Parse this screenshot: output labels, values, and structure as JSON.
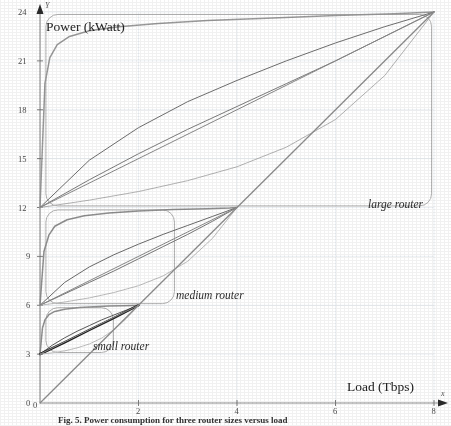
{
  "figure": {
    "caption": "Fig. 5. Power consumption for three router sizes versus load",
    "y_axis": {
      "title": "Power (kWatt)",
      "arrow_letter": "Y",
      "ticks": [
        0,
        3,
        6,
        9,
        12,
        15,
        18,
        21,
        24
      ],
      "range": [
        0,
        24
      ]
    },
    "x_axis": {
      "title": "Load (Tbps)",
      "arrow_letter": "x",
      "ticks": [
        0,
        2,
        4,
        6,
        8
      ],
      "range": [
        0,
        8
      ]
    },
    "groups": [
      {
        "name": "small-router",
        "label": "small router",
        "base_power": 3,
        "max_load": 2
      },
      {
        "name": "medium-router",
        "label": "medium router",
        "base_power": 6,
        "max_load": 4
      },
      {
        "name": "large-router",
        "label": "large router",
        "base_power": 12,
        "max_load": 8
      }
    ]
  },
  "chart_data": {
    "type": "line",
    "title": "",
    "xlabel": "Load (Tbps)",
    "ylabel": "Power (kWatt)",
    "xlim": [
      0,
      8
    ],
    "ylim": [
      0,
      24
    ],
    "xticks": [
      0,
      2,
      4,
      6,
      8
    ],
    "yticks": [
      0,
      3,
      6,
      9,
      12,
      15,
      18,
      21,
      24
    ],
    "grid": true,
    "legend": "annotations",
    "annotations": [
      {
        "text": "small router",
        "x": 2.05,
        "y": 3.3
      },
      {
        "text": "medium router",
        "x": 4.15,
        "y": 6.3
      },
      {
        "text": "large router",
        "x": 8.1,
        "y": 12.4
      }
    ],
    "series": [
      {
        "name": "large-router-step",
        "group": "large router",
        "color": "#9a9a9a",
        "x": [
          0,
          0.1,
          0.2,
          0.35,
          0.6,
          1,
          1.6,
          2.4,
          3.4,
          4.6,
          6,
          7.2,
          8
        ],
        "y": [
          12,
          19.6,
          21.2,
          22.0,
          22.5,
          22.85,
          23.1,
          23.3,
          23.48,
          23.62,
          23.78,
          23.9,
          24
        ]
      },
      {
        "name": "large-router-concave-a",
        "group": "large router",
        "color": "#6f6f6f",
        "x": [
          0,
          1,
          2,
          3,
          4,
          5,
          6,
          7,
          8
        ],
        "y": [
          12,
          14.9,
          16.9,
          18.5,
          19.8,
          21.0,
          22.1,
          23.1,
          24
        ]
      },
      {
        "name": "large-router-concave-b",
        "group": "large router",
        "color": "#7d7d7d",
        "x": [
          0,
          1,
          2,
          3,
          4,
          5,
          6,
          7,
          8
        ],
        "y": [
          12,
          13.7,
          15.3,
          16.8,
          18.2,
          19.6,
          21.0,
          22.5,
          24
        ]
      },
      {
        "name": "large-router-shallow",
        "group": "large router",
        "color": "#b4b4b4",
        "x": [
          0,
          1,
          2,
          3,
          4,
          5,
          6,
          7,
          8
        ],
        "y": [
          12,
          12.45,
          12.98,
          13.65,
          14.5,
          15.7,
          17.4,
          20.1,
          24
        ]
      },
      {
        "name": "large-router-linear",
        "group": "large router",
        "color": "#8a8a8a",
        "x": [
          0,
          8
        ],
        "y": [
          12,
          24
        ]
      },
      {
        "name": "medium-router-step",
        "group": "medium router",
        "color": "#8f8f8f",
        "x": [
          0,
          0.08,
          0.18,
          0.3,
          0.55,
          0.9,
          1.4,
          2.0,
          2.7,
          3.4,
          3.85,
          4
        ],
        "y": [
          6,
          9.3,
          10.3,
          10.85,
          11.25,
          11.5,
          11.66,
          11.78,
          11.87,
          11.93,
          11.97,
          12
        ]
      },
      {
        "name": "medium-router-concave-a",
        "group": "medium router",
        "color": "#6b6b6b",
        "x": [
          0,
          0.5,
          1,
          1.5,
          2,
          2.5,
          3,
          3.5,
          4
        ],
        "y": [
          6,
          7.4,
          8.35,
          9.1,
          9.75,
          10.35,
          10.9,
          11.45,
          12
        ]
      },
      {
        "name": "medium-router-concave-b",
        "group": "medium router",
        "color": "#787878",
        "x": [
          0,
          0.5,
          1,
          1.5,
          2,
          2.5,
          3,
          3.5,
          4
        ],
        "y": [
          6,
          6.7,
          7.4,
          8.1,
          8.85,
          9.6,
          10.35,
          11.15,
          12
        ]
      },
      {
        "name": "medium-router-shallow",
        "group": "medium router",
        "color": "#bdbdbd",
        "x": [
          0,
          0.5,
          1,
          1.5,
          2,
          2.5,
          3,
          3.5,
          4
        ],
        "y": [
          6,
          6.2,
          6.45,
          6.78,
          7.2,
          7.8,
          8.7,
          10.1,
          12
        ]
      },
      {
        "name": "medium-router-linear",
        "group": "medium router",
        "color": "#8a8a8a",
        "x": [
          0,
          4
        ],
        "y": [
          6,
          12
        ]
      },
      {
        "name": "small-router-step",
        "group": "small router",
        "color": "#909090",
        "x": [
          0,
          0.05,
          0.1,
          0.18,
          0.3,
          0.5,
          0.8,
          1.1,
          1.4,
          1.7,
          1.9,
          2
        ],
        "y": [
          3,
          4.6,
          5.1,
          5.42,
          5.62,
          5.76,
          5.86,
          5.91,
          5.95,
          5.97,
          5.99,
          6
        ]
      },
      {
        "name": "small-router-concave-a",
        "group": "small router",
        "color": "#5a5a5a",
        "x": [
          0,
          0.25,
          0.5,
          0.75,
          1,
          1.25,
          1.5,
          1.75,
          2
        ],
        "y": [
          3,
          3.55,
          4.0,
          4.4,
          4.75,
          5.1,
          5.4,
          5.7,
          6
        ]
      },
      {
        "name": "small-router-bold",
        "group": "small router",
        "color": "#1e1e1e",
        "x": [
          0,
          0.5,
          1,
          1.5,
          2
        ],
        "y": [
          3,
          3.72,
          4.48,
          5.22,
          6
        ]
      },
      {
        "name": "small-router-shallow",
        "group": "small router",
        "color": "#c0c0c0",
        "x": [
          0,
          0.25,
          0.5,
          0.75,
          1,
          1.25,
          1.5,
          1.75,
          2
        ],
        "y": [
          3,
          3.08,
          3.2,
          3.38,
          3.62,
          3.98,
          4.5,
          5.18,
          6
        ]
      },
      {
        "name": "small-router-linear",
        "group": "small router",
        "color": "#8a8a8a",
        "x": [
          0,
          2
        ],
        "y": [
          3,
          6
        ]
      },
      {
        "name": "origin-diagonal",
        "group": "reference",
        "color": "#8e8e8e",
        "x": [
          0,
          8
        ],
        "y": [
          0,
          24
        ]
      }
    ]
  }
}
